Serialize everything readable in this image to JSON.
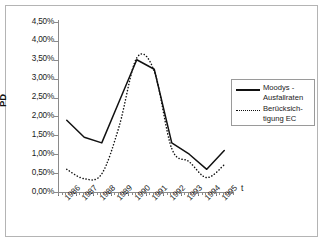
{
  "chart_data": {
    "type": "line",
    "title": "",
    "xlabel": "t",
    "ylabel": "PD",
    "ylim": [
      0,
      4.5
    ],
    "ytick_labels": [
      "4,50%",
      "4,00%",
      "3,50%",
      "3,00%",
      "2,50%",
      "2,00%",
      "1,50%",
      "1,00%",
      "0,50%",
      "0,00%"
    ],
    "ytick_values": [
      4.5,
      4.0,
      3.5,
      3.0,
      2.5,
      2.0,
      1.5,
      1.0,
      0.5,
      0.0
    ],
    "categories": [
      "1986",
      "1987",
      "1988",
      "1989",
      "1990",
      "1991",
      "1992",
      "1993",
      "1994",
      "1995"
    ],
    "grid": false,
    "legend_position": "right-inside",
    "series": [
      {
        "name": "Moodys - Ausfallraten",
        "style": "solid",
        "values": [
          1.9,
          1.45,
          1.3,
          2.4,
          3.5,
          3.25,
          1.3,
          1.0,
          0.6,
          1.1
        ]
      },
      {
        "name": "Berücksichtigung EC",
        "style": "dotted",
        "values": [
          0.6,
          0.35,
          0.48,
          1.75,
          3.55,
          3.2,
          1.15,
          0.8,
          0.38,
          0.72
        ]
      }
    ]
  },
  "legend": {
    "entries": [
      {
        "label": "Moodys -\nAusfallraten",
        "style": "solid"
      },
      {
        "label": "Berücksich-\ntigung EC",
        "style": "dotted"
      }
    ]
  },
  "axes": {
    "y_title": "PD",
    "x_title": "t"
  }
}
